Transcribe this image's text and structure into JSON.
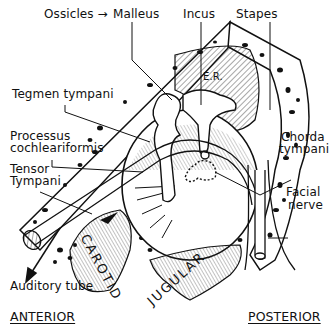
{
  "figure": {
    "type": "anatomical-diagram",
    "labels": {
      "ossicles": "Ossicles",
      "ossicles_arrow": "→",
      "malleus": "Malleus",
      "incus": "Incus",
      "stapes": "Stapes",
      "er": "E.R.",
      "tegmen_tympani": "Tegmen tympani",
      "processus_line1": "Processus",
      "processus_line2": "cochleariformis",
      "tensor_line1": "Tensor",
      "tensor_line2": "Tympani",
      "chorda_line1": "Chorda",
      "chorda_line2": "tympani",
      "facial_line1": "Facial",
      "facial_line2": "nerve",
      "auditory_tube": "Auditory tube",
      "carotid": "CAROTID",
      "jugular": "JUGULAR"
    },
    "orientation": {
      "anterior": "ANTERIOR",
      "posterior": "POSTERIOR"
    },
    "colors": {
      "ink": "#111111",
      "background": "#ffffff"
    }
  }
}
